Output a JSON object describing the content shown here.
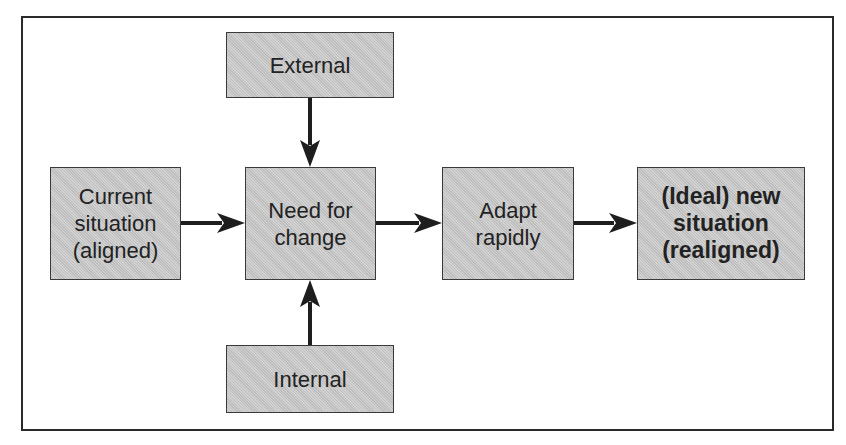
{
  "diagram": {
    "type": "flow",
    "nodes": [
      {
        "id": "external",
        "label": "External",
        "bold": false
      },
      {
        "id": "current",
        "label": "Current\nsituation\n(aligned)",
        "bold": false
      },
      {
        "id": "need",
        "label": "Need for\nchange",
        "bold": false
      },
      {
        "id": "adapt",
        "label": "Adapt\nrapidly",
        "bold": false
      },
      {
        "id": "ideal",
        "label": "(Ideal) new\nsituation\n(realigned)",
        "bold": true
      },
      {
        "id": "internal",
        "label": "Internal",
        "bold": false
      }
    ],
    "edges": [
      {
        "from": "external",
        "to": "need"
      },
      {
        "from": "internal",
        "to": "need"
      },
      {
        "from": "current",
        "to": "need"
      },
      {
        "from": "need",
        "to": "adapt"
      },
      {
        "from": "adapt",
        "to": "ideal"
      }
    ],
    "colors": {
      "box_fill": "#c9c9c9",
      "stroke": "#222222",
      "frame": "#2a2a2a"
    }
  }
}
